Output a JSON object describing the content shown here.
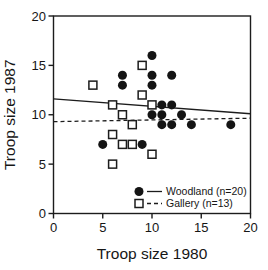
{
  "chart_data": {
    "type": "scatter",
    "title": "",
    "xlabel": "Troop size 1980",
    "ylabel": "Troop size 1987",
    "xlim": [
      0,
      20
    ],
    "ylim": [
      0,
      20
    ],
    "xticks": [
      0,
      5,
      10,
      15,
      20
    ],
    "yticks": [
      0,
      5,
      10,
      15,
      20
    ],
    "grid": false,
    "legend_position": "inside-bottom-right",
    "series": [
      {
        "name": "Woodland (n=20)",
        "n": 20,
        "marker": "filled-circle",
        "line_style": "solid",
        "color": "#141414",
        "points": [
          [
            5,
            7
          ],
          [
            7,
            13
          ],
          [
            7,
            14
          ],
          [
            9,
            7
          ],
          [
            10,
            10
          ],
          [
            10,
            13
          ],
          [
            10,
            14
          ],
          [
            10,
            16
          ],
          [
            11,
            9
          ],
          [
            11,
            10
          ],
          [
            11,
            11
          ],
          [
            12,
            9
          ],
          [
            12,
            11
          ],
          [
            12,
            14
          ],
          [
            13,
            10
          ],
          [
            14,
            9
          ],
          [
            18,
            9
          ]
        ],
        "trend_line": {
          "x": [
            0,
            20
          ],
          "y": [
            11.6,
            10.1
          ]
        }
      },
      {
        "name": "Gallery (n=13)",
        "n": 13,
        "marker": "open-square",
        "line_style": "dashed",
        "color": "#141414",
        "points": [
          [
            4,
            13
          ],
          [
            6,
            5
          ],
          [
            6,
            8
          ],
          [
            6,
            11
          ],
          [
            7,
            7
          ],
          [
            7,
            10
          ],
          [
            8,
            7
          ],
          [
            8,
            9
          ],
          [
            9,
            12
          ],
          [
            9,
            15
          ],
          [
            10,
            6
          ],
          [
            10,
            11
          ]
        ],
        "trend_line": {
          "x": [
            0,
            20
          ],
          "y": [
            9.3,
            9.65
          ]
        }
      }
    ]
  }
}
